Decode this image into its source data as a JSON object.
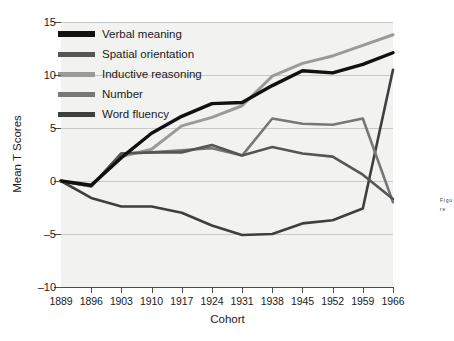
{
  "chart_data": {
    "type": "line",
    "title": "",
    "xlabel": "Cohort",
    "ylabel": "Mean T Scores",
    "categories": [
      1889,
      1896,
      1903,
      1910,
      1917,
      1924,
      1931,
      1938,
      1945,
      1952,
      1959,
      1966
    ],
    "xlim": [
      1889,
      1966
    ],
    "ylim": [
      -10,
      15
    ],
    "yticks": [
      15,
      10,
      5,
      0,
      -5,
      -10
    ],
    "ytick_labels": [
      "15",
      "10",
      "5",
      "0",
      "–5",
      "–10"
    ],
    "xticks": [
      1889,
      1896,
      1903,
      1910,
      1917,
      1924,
      1931,
      1938,
      1945,
      1952,
      1959,
      1966
    ],
    "xtick_labels": [
      "1889",
      "1896",
      "1903",
      "1910",
      "1917",
      "1924",
      "1931",
      "1938",
      "1945",
      "1952",
      "1959",
      "1966"
    ],
    "grid": true,
    "grid_axis": "y",
    "legend_position": "upper left",
    "plot_background": "#f2f2f0",
    "series": [
      {
        "name": "Verbal meaning",
        "color": "#111111",
        "width": 3.4,
        "values": [
          0,
          -0.4,
          2.2,
          4.5,
          6.1,
          7.3,
          7.4,
          9.0,
          10.4,
          10.2,
          11.0,
          12.1
        ]
      },
      {
        "name": "Spatial orientation",
        "color": "#555555",
        "width": 2.6,
        "values": [
          0,
          -0.5,
          2.6,
          2.7,
          2.7,
          3.4,
          2.4,
          3.2,
          2.6,
          2.3,
          0.6,
          -1.7
        ]
      },
      {
        "name": "Inductive reasoning",
        "color": "#9a9a9a",
        "width": 3.0,
        "values": [
          0,
          -0.5,
          2.3,
          3.0,
          5.2,
          6.0,
          7.1,
          9.9,
          11.1,
          11.8,
          12.8,
          13.8
        ]
      },
      {
        "name": "Number",
        "color": "#777777",
        "width": 2.6,
        "values": [
          0,
          -0.5,
          2.6,
          2.7,
          2.9,
          3.1,
          2.4,
          5.9,
          5.4,
          5.3,
          5.9,
          -2.0
        ]
      },
      {
        "name": "Word fluency",
        "color": "#3f3f3f",
        "width": 2.6,
        "values": [
          0,
          -1.6,
          -2.4,
          -2.4,
          -3.0,
          -4.2,
          -5.1,
          -5.0,
          -4.0,
          -3.7,
          -2.6,
          10.5
        ]
      }
    ]
  },
  "legend": {
    "items": [
      {
        "label": "Verbal meaning",
        "color": "#111111",
        "thickness": "6px"
      },
      {
        "label": "Spatial orientation",
        "color": "#555555",
        "thickness": "5px"
      },
      {
        "label": "Inductive reasoning",
        "color": "#9a9a9a",
        "thickness": "5px"
      },
      {
        "label": "Number",
        "color": "#777777",
        "thickness": "5px"
      },
      {
        "label": "Word fluency",
        "color": "#3f3f3f",
        "thickness": "5px"
      }
    ]
  },
  "side_caption": {
    "text": "F i g u r e"
  }
}
